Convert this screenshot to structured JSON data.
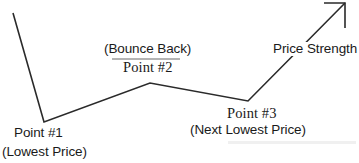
{
  "figure": {
    "background_color": "#ffffff",
    "line_color": "#2a2a2a",
    "underline_color": "#b4b4b4"
  },
  "labels": {
    "point1": "Point #1",
    "lowest_price": "(Lowest Price)",
    "bounce_back": "(Bounce Back)",
    "point2": "Point #2",
    "point3": "Point #3",
    "next_lowest_price": "(Next Lowest Price)",
    "price_strength": "Price Strength"
  },
  "chart_data": {
    "type": "line",
    "title": "",
    "xlabel": "",
    "ylabel": "",
    "grid": false,
    "legend": false,
    "xlim": [
      0,
      359
    ],
    "ylim": [
      163,
      0
    ],
    "axis_note": "y values are screen pixel coordinates; lower y = higher price",
    "series": [
      {
        "name": "price",
        "points": [
          {
            "x": 13,
            "y": 13,
            "label": ""
          },
          {
            "x": 44,
            "y": 122,
            "label": "Point #1"
          },
          {
            "x": 150,
            "y": 83,
            "label": "Point #2"
          },
          {
            "x": 248,
            "y": 101,
            "label": "Point #3"
          },
          {
            "x": 345,
            "y": 3,
            "label": "Price Strength"
          }
        ]
      }
    ],
    "annotations": [
      {
        "text": "Point #1",
        "x": 14,
        "y": 132
      },
      {
        "text": "(Lowest Price)",
        "x": 2,
        "y": 151
      },
      {
        "text": "(Bounce Back)",
        "x": 104,
        "y": 48
      },
      {
        "text": "Point #2",
        "x": 123,
        "y": 67
      },
      {
        "text": "Point #3",
        "x": 227,
        "y": 112
      },
      {
        "text": "(Next Lowest Price)",
        "x": 190,
        "y": 129
      },
      {
        "text": "Price Strength",
        "x": 272,
        "y": 48
      }
    ],
    "arrow": {
      "at": [
        345,
        3
      ],
      "direction": "up-right",
      "style": "open-v"
    }
  }
}
